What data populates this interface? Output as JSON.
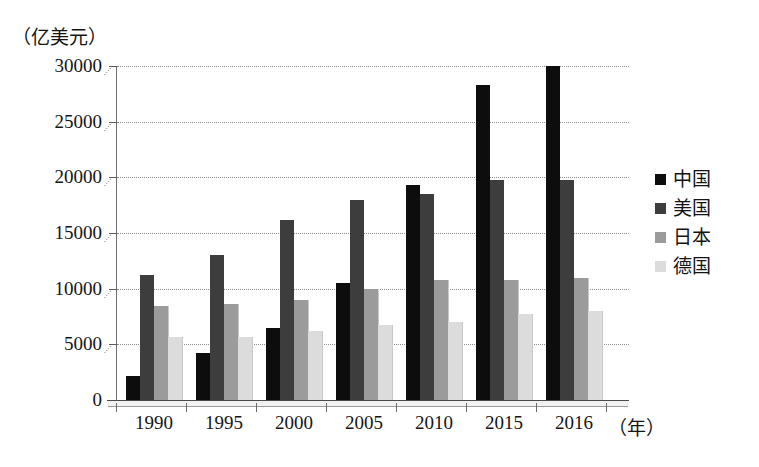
{
  "chart_data": {
    "type": "bar",
    "title": "",
    "unit_label_y": "（亿美元）",
    "unit_label_x": "（年）",
    "xlabel": "年",
    "ylabel": "亿美元",
    "ylim": [
      0,
      30000
    ],
    "y_ticks": [
      0,
      5000,
      10000,
      15000,
      20000,
      25000,
      30000
    ],
    "y_tick_labels": [
      "0",
      "5000",
      "10000",
      "15000",
      "20000",
      "25000",
      "30000"
    ],
    "grid": true,
    "grid_axis": "y",
    "legend_position": "right",
    "categories": [
      "1990",
      "1995",
      "2000",
      "2005",
      "2010",
      "2015",
      "2016"
    ],
    "series": [
      {
        "name": "中国",
        "color": "#0d0d0d",
        "values": [
          2200,
          4200,
          6500,
          10500,
          19300,
          28300,
          30000
        ]
      },
      {
        "name": "美国",
        "color": "#3d3d3d",
        "values": [
          11200,
          13000,
          16200,
          18000,
          18500,
          19800,
          19800
        ]
      },
      {
        "name": "日本",
        "color": "#9b9b9b",
        "values": [
          8400,
          8600,
          9000,
          10000,
          10800,
          10800,
          11000
        ]
      },
      {
        "name": "德国",
        "color": "#dcdcdc",
        "values": [
          5700,
          5700,
          6200,
          6700,
          7000,
          7700,
          8000
        ]
      }
    ]
  },
  "legend": {
    "items": [
      {
        "label": "中国",
        "color": "#0d0d0d"
      },
      {
        "label": "美国",
        "color": "#3d3d3d"
      },
      {
        "label": "日本",
        "color": "#9b9b9b"
      },
      {
        "label": "德国",
        "color": "#dcdcdc"
      }
    ]
  }
}
